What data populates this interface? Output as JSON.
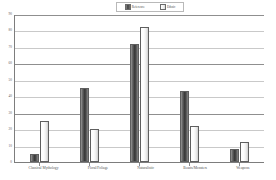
{
  "chart_data": {
    "type": "bar",
    "title": "",
    "subtitle": "",
    "xlabel": "",
    "ylabel": "",
    "ylim": [
      0,
      90
    ],
    "ytick_step": 10,
    "yticks": [
      "90",
      "80",
      "70",
      "60",
      "50",
      "40",
      "30",
      "20",
      "10",
      "0"
    ],
    "grid": true,
    "legend_position": "top-center",
    "categories": [
      "Classical Mythology",
      "Floral/Foliage",
      "Naturalistic",
      "Beasts/Monsters",
      "Weapons"
    ],
    "series": [
      {
        "name": "Reference",
        "color": "#3f3f3f",
        "values": [
          5,
          45,
          72,
          43,
          8
        ]
      },
      {
        "name": "Ethnic",
        "color": "#f0f0f0",
        "values": [
          25,
          20,
          82,
          22,
          12
        ]
      }
    ]
  },
  "legend": {
    "items": [
      {
        "label": "Reference",
        "swatch": "series1-swatch"
      },
      {
        "label": "Ethnic",
        "swatch": "series2-swatch"
      }
    ]
  }
}
